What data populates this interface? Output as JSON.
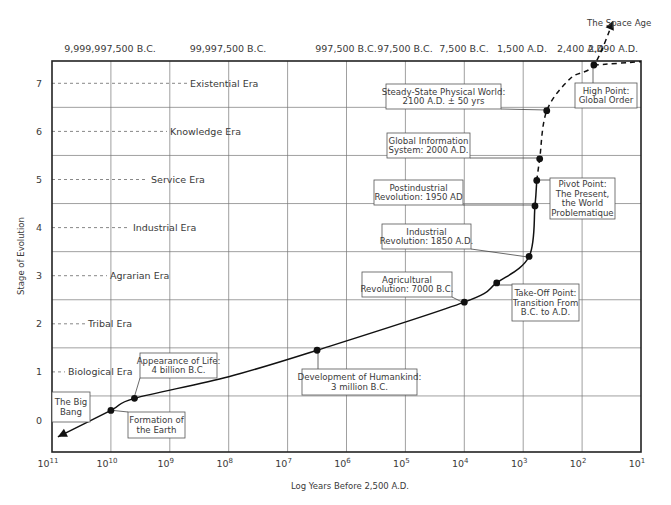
{
  "chart_data": {
    "type": "line",
    "title": "",
    "xlabel": "Log Years Before 2,500 A.D.",
    "ylabel": "Stage of Evolution",
    "x_scale": "log",
    "x_reversed": true,
    "xlim": [
      100000000000,
      10
    ],
    "ylim": [
      -0.65,
      7.45
    ],
    "grid": true,
    "x_ticks": [
      {
        "exp": "11",
        "value": 100000000000
      },
      {
        "exp": "10",
        "value": 10000000000
      },
      {
        "exp": "9",
        "value": 1000000000
      },
      {
        "exp": "8",
        "value": 100000000
      },
      {
        "exp": "7",
        "value": 10000000
      },
      {
        "exp": "6",
        "value": 1000000
      },
      {
        "exp": "5",
        "value": 100000
      },
      {
        "exp": "4",
        "value": 10000
      },
      {
        "exp": "3",
        "value": 1000
      },
      {
        "exp": "2",
        "value": 100
      },
      {
        "exp": "1",
        "value": 10
      }
    ],
    "x_tick_base": "10",
    "top_axis_labels": [
      {
        "label": "9,999,997,500 B.C.",
        "at_log": 10
      },
      {
        "label": "99,997,500 B.C.",
        "at_log": 8
      },
      {
        "label": "997,500 B.C.",
        "at_log": 6
      },
      {
        "label": "97,500 B.C.",
        "at_log": 5
      },
      {
        "label": "7,500 B.C.",
        "at_log": 4
      },
      {
        "label": "1,500 A.D.",
        "at_log": 3
      },
      {
        "label": "2,400 A.D.",
        "at_log": 2
      },
      {
        "label": "2,490 A.D.",
        "at_log": 1
      }
    ],
    "y_ticks": [
      0,
      1,
      2,
      3,
      4,
      5,
      6,
      7
    ],
    "eras": [
      {
        "stage": 1,
        "label": "Biological Era"
      },
      {
        "stage": 2,
        "label": "Tribal Era"
      },
      {
        "stage": 3,
        "label": "Agrarian Era"
      },
      {
        "stage": 4,
        "label": "Industrial Era"
      },
      {
        "stage": 5,
        "label": "Service Era"
      },
      {
        "stage": 6,
        "label": "Knowledge Era"
      },
      {
        "stage": 7,
        "label": "Existential Era"
      }
    ],
    "series": [
      {
        "name": "Historical evolution (solid)",
        "style": "solid",
        "points": [
          {
            "log_years": 10.9,
            "stage": -0.35,
            "marker": "arrow"
          },
          {
            "log_years": 10.0,
            "stage": 0.2,
            "marker": "dot"
          },
          {
            "log_years": 9.6,
            "stage": 0.45,
            "marker": "dot"
          },
          {
            "log_years": 8.0,
            "stage": 0.9
          },
          {
            "log_years": 6.5,
            "stage": 1.45,
            "marker": "dot"
          },
          {
            "log_years": 4.0,
            "stage": 2.45,
            "marker": "dot"
          },
          {
            "log_years": 3.45,
            "stage": 2.85,
            "marker": "dot"
          },
          {
            "log_years": 2.9,
            "stage": 3.4,
            "marker": "dot"
          },
          {
            "log_years": 2.8,
            "stage": 4.45,
            "marker": "dot"
          },
          {
            "log_years": 2.77,
            "stage": 4.98,
            "marker": "dot"
          }
        ]
      },
      {
        "name": "Projected evolution (dashed)",
        "style": "dashed",
        "points": [
          {
            "log_years": 2.77,
            "stage": 4.98
          },
          {
            "log_years": 2.72,
            "stage": 5.43,
            "marker": "dot"
          },
          {
            "log_years": 2.6,
            "stage": 6.43,
            "marker": "dot"
          },
          {
            "log_years": 2.2,
            "stage": 7.1
          },
          {
            "log_years": 1.8,
            "stage": 7.38,
            "marker": "dot"
          },
          {
            "log_years": 1.47,
            "stage": 8.3,
            "marker": "arrow"
          }
        ]
      },
      {
        "name": "Tail (dashed)",
        "style": "dashed",
        "points": [
          {
            "log_years": 1.8,
            "stage": 7.38
          },
          {
            "log_years": 1.0,
            "stage": 7.45
          }
        ]
      }
    ],
    "annotations": [
      {
        "lines": [
          "The Big",
          "Bang"
        ],
        "box": [
          52,
          392,
          38,
          30
        ],
        "target": null
      },
      {
        "lines": [
          "Formation of",
          "the Earth"
        ],
        "box": [
          128,
          412,
          57,
          26
        ],
        "target": [
          109,
          410
        ]
      },
      {
        "lines": [
          "Appearance of Life:",
          "4 billion B.C."
        ],
        "box": [
          140,
          353,
          77,
          25
        ],
        "target": [
          134,
          398
        ]
      },
      {
        "lines": [
          "Development of Humankind:",
          "3 million B.C."
        ],
        "box": [
          302,
          369,
          115,
          26
        ],
        "target": [
          318,
          350
        ]
      },
      {
        "lines": [
          "Agricultural",
          "Revolution: 7000 B.C."
        ],
        "box": [
          362,
          272,
          90,
          25
        ],
        "target": [
          464,
          303
        ]
      },
      {
        "lines": [
          "Take-Off Point:",
          "Transition From",
          "B.C. to A.D."
        ],
        "box": [
          512,
          284,
          67,
          37
        ],
        "target": [
          498,
          285
        ]
      },
      {
        "lines": [
          "Industrial",
          "Revolution: 1850 A.D."
        ],
        "box": [
          382,
          224,
          89,
          25
        ],
        "target": [
          528,
          257
        ]
      },
      {
        "lines": [
          "Postindustrial",
          "Revolution: 1950 AD"
        ],
        "box": [
          374,
          180,
          89,
          25
        ],
        "target": [
          535,
          205
        ]
      },
      {
        "lines": [
          "Pivot Point:",
          "The Present,",
          "the World",
          "Problematique"
        ],
        "box": [
          550,
          178,
          65,
          41
        ],
        "target": [
          537,
          180
        ]
      },
      {
        "lines": [
          "Global Information",
          "System: 2000 A.D."
        ],
        "box": [
          387,
          133,
          83,
          25
        ],
        "target": [
          540,
          158
        ]
      },
      {
        "lines": [
          "Steady-State Physical World:",
          "2100 A.D. ± 50 yrs"
        ],
        "box": [
          386,
          84,
          115,
          25
        ],
        "target": [
          547,
          110
        ]
      },
      {
        "lines": [
          "High Point:",
          "Global Order"
        ],
        "box": [
          575,
          83,
          62,
          25
        ],
        "target": [
          593,
          65
        ]
      },
      {
        "lines": [
          "The Space Age"
        ],
        "box": null,
        "text_at": [
          587,
          26
        ],
        "target": null
      }
    ]
  }
}
